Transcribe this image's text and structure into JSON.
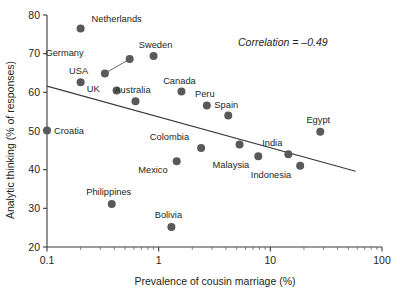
{
  "chart_data": {
    "type": "scatter",
    "title": "",
    "xlabel": "Prevalence of cousin marriage (%)",
    "ylabel": "Analytic thinking (% of responses)",
    "xscale": "log",
    "xlim": [
      0.1,
      100
    ],
    "ylim": [
      20,
      80
    ],
    "xticks": [
      "0.1",
      "1",
      "10",
      "100"
    ],
    "yticks": [
      "20",
      "30",
      "40",
      "50",
      "60",
      "70",
      "80"
    ],
    "grid": false,
    "legend": "none",
    "annotation": "Correlation = –0.49",
    "annotation_value": -0.49,
    "points": [
      {
        "label": "Netherlands",
        "x": 0.2,
        "y": 76.5,
        "label_dx": 11,
        "label_dy": -7
      },
      {
        "label": "Sweden",
        "x": 0.9,
        "y": 69.4,
        "label_dx": 2,
        "label_dy": -8
      },
      {
        "label": "Germany",
        "x": 0.55,
        "y": 68.6,
        "label_dx": -46,
        "label_dy": -3,
        "leader": {
          "x2": 0.33,
          "y2": 64.9
        }
      },
      {
        "label": "",
        "x": 0.33,
        "y": 64.9,
        "label_dx": 0,
        "label_dy": 0
      },
      {
        "label": "USA",
        "x": 0.2,
        "y": 62.6,
        "label_dx": -2,
        "label_dy": -8
      },
      {
        "label": "UK",
        "x": 0.42,
        "y": 60.5,
        "label_dx": -17,
        "label_dy": 2
      },
      {
        "label": "Australia",
        "x": 0.62,
        "y": 57.7,
        "label_dx": -3,
        "label_dy": -8
      },
      {
        "label": "Canada",
        "x": 1.6,
        "y": 60.2,
        "label_dx": -2,
        "label_dy": -8
      },
      {
        "label": "Peru",
        "x": 2.7,
        "y": 56.6,
        "label_dx": -2,
        "label_dy": -8
      },
      {
        "label": "Spain",
        "x": 4.2,
        "y": 54.0,
        "label_dx": -2,
        "label_dy": -8
      },
      {
        "label": "Croatia",
        "x": 0.1,
        "y": 50.1,
        "label_dx": 7,
        "label_dy": 3
      },
      {
        "label": "Colombia",
        "x": 2.4,
        "y": 45.6,
        "label_dx": -12,
        "label_dy": -8
      },
      {
        "label": "Mexico",
        "x": 1.45,
        "y": 42.2,
        "label_dx": -9,
        "label_dy": 12
      },
      {
        "label": "",
        "x": 5.3,
        "y": 46.5,
        "label_dx": 0,
        "label_dy": 0
      },
      {
        "label": "Malaysia",
        "x": 7.8,
        "y": 43.5,
        "label_dx": -9,
        "label_dy": 12
      },
      {
        "label": "India",
        "x": 14.5,
        "y": 44.0,
        "label_dx": -6,
        "label_dy": -8
      },
      {
        "label": "Indonesia",
        "x": 18.5,
        "y": 41.0,
        "label_dx": -9,
        "label_dy": 12
      },
      {
        "label": "Egypt",
        "x": 28.0,
        "y": 49.8,
        "label_dx": -2,
        "label_dy": -9
      },
      {
        "label": "Philippines",
        "x": 0.38,
        "y": 31.1,
        "label_dx": -3,
        "label_dy": -9
      },
      {
        "label": "Bolivia",
        "x": 1.3,
        "y": 25.2,
        "label_dx": -3,
        "label_dy": -9
      }
    ],
    "trend": {
      "x1": 0.1,
      "y1": 61.6,
      "x2": 58.0,
      "y2": 39.6
    }
  }
}
